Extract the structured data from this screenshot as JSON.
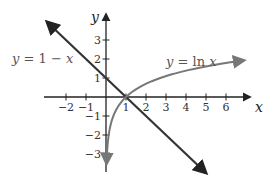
{
  "chart_data": {
    "type": "line",
    "title": "",
    "xlabel": "x",
    "ylabel": "y",
    "xlim": [
      -3,
      7
    ],
    "ylim": [
      -3.8,
      4
    ],
    "grid": false,
    "x_ticks": [
      -2,
      -1,
      1,
      2,
      3,
      4,
      5,
      6
    ],
    "y_ticks": [
      -3,
      -2,
      -1,
      1,
      2,
      3
    ],
    "x_tick_labels": [
      "−2",
      "−1",
      "1",
      "2",
      "3",
      "4",
      "5",
      "6"
    ],
    "y_tick_labels": [
      "−3",
      "−2",
      "−1",
      "1",
      "2",
      "3"
    ],
    "series": [
      {
        "name": "y = 1 − x",
        "label_parts": [
          "y",
          " = 1 − ",
          "x"
        ],
        "function": "1 - x",
        "domain": [
          -2.95,
          5.0
        ],
        "color": "#333333",
        "arrows": "both",
        "x": [
          -2.95,
          0,
          1,
          5.0
        ],
        "values": [
          3.95,
          1,
          0,
          -4.0
        ]
      },
      {
        "name": "y = ln x",
        "label_parts": [
          "y",
          " = ln ",
          "x"
        ],
        "function": "ln(x)",
        "domain": [
          0.03,
          6.9
        ],
        "color": "#777777",
        "arrows": "both",
        "x": [
          0.03,
          0.1,
          0.25,
          0.5,
          1,
          2,
          3,
          4,
          5,
          6,
          6.9
        ],
        "values": [
          -3.5,
          -2.3,
          -1.39,
          -0.69,
          0,
          0.69,
          1.1,
          1.39,
          1.61,
          1.79,
          1.93
        ]
      }
    ],
    "annotations": [
      {
        "text": "y = 1 − x",
        "near": [
          -3.0,
          2.0
        ]
      },
      {
        "text": "y = ln x",
        "near": [
          4.5,
          2.3
        ]
      }
    ],
    "intersection": {
      "x": 1,
      "y": 0
    }
  }
}
